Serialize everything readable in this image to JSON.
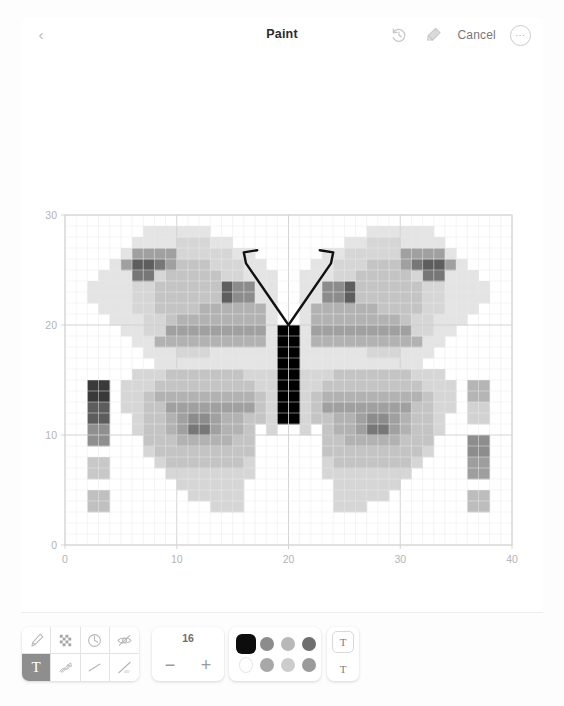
{
  "topbar": {
    "back_icon": "chevron-left-icon",
    "title": "Paint",
    "undo_icon": "undo-history-icon",
    "eraser_icon": "eraser-icon",
    "cancel_label": "Cancel",
    "more_label": "⋯"
  },
  "toolbar": {
    "tools": [
      {
        "name": "brush-tool",
        "glyph": "brush",
        "active": false
      },
      {
        "name": "checker-fill-tool",
        "glyph": "checker",
        "active": false
      },
      {
        "name": "clock-tool",
        "glyph": "clock",
        "active": false
      },
      {
        "name": "visibility-tool",
        "glyph": "eye-slash",
        "active": false
      },
      {
        "name": "text-tool",
        "glyph": "T",
        "active": true
      },
      {
        "name": "scribble-tool",
        "glyph": "scribble",
        "active": false
      },
      {
        "name": "line-tool",
        "glyph": "line",
        "active": false
      },
      {
        "name": "angle-tool",
        "glyph": "angle45",
        "active": false
      }
    ],
    "stepper": {
      "value": "16",
      "decrease_label": "−",
      "increase_label": "+"
    },
    "palette": {
      "colors": [
        {
          "hex": "#0d0d0d",
          "selected": true
        },
        {
          "hex": "#8c8c8c",
          "selected": false
        },
        {
          "hex": "#b8b8b8",
          "selected": false
        },
        {
          "hex": "#6e6e6e",
          "selected": false
        },
        {
          "hex": "#ffffff",
          "selected": false
        },
        {
          "hex": "#a8a8a8",
          "selected": false
        },
        {
          "hex": "#cccccc",
          "selected": false
        },
        {
          "hex": "#9a9a9a",
          "selected": false
        }
      ]
    },
    "text_sizes": [
      {
        "name": "text-size-boxed",
        "label": "T",
        "boxed": true
      },
      {
        "name": "text-size-plain",
        "label": "T",
        "boxed": false
      }
    ]
  },
  "chart_data": {
    "type": "heatmap",
    "title": "",
    "xlabel": "",
    "ylabel": "",
    "xlim": [
      0,
      40
    ],
    "ylim": [
      0,
      30
    ],
    "xticks": [
      0,
      10,
      20,
      30,
      40
    ],
    "yticks": [
      0,
      10,
      20,
      30
    ],
    "grid": true,
    "legend": "none",
    "cell_size": 1,
    "annotations": [
      {
        "name": "left-antenna",
        "type": "polyline",
        "points": [
          [
            20,
            20
          ],
          [
            16.2,
            25.6
          ],
          [
            16.0,
            26.6
          ],
          [
            17.2,
            26.8
          ]
        ]
      },
      {
        "name": "right-antenna",
        "type": "polyline",
        "points": [
          [
            20,
            20
          ],
          [
            23.8,
            25.6
          ],
          [
            24.0,
            26.6
          ],
          [
            22.8,
            26.8
          ]
        ]
      }
    ],
    "colormap": "greys",
    "cells": [
      [
        2,
        13,
        "#3a3a3a"
      ],
      [
        3,
        13,
        "#3a3a3a"
      ],
      [
        2,
        14,
        "#3a3a3a"
      ],
      [
        3,
        14,
        "#3a3a3a"
      ],
      [
        2,
        11,
        "#5d5d5d"
      ],
      [
        3,
        11,
        "#5d5d5d"
      ],
      [
        2,
        12,
        "#5d5d5d"
      ],
      [
        3,
        12,
        "#5d5d5d"
      ],
      [
        2,
        9,
        "#8f8f8f"
      ],
      [
        3,
        9,
        "#8f8f8f"
      ],
      [
        2,
        10,
        "#8f8f8f"
      ],
      [
        3,
        10,
        "#8f8f8f"
      ],
      [
        2,
        6,
        "#c8c8c8"
      ],
      [
        3,
        6,
        "#c8c8c8"
      ],
      [
        2,
        7,
        "#c8c8c8"
      ],
      [
        3,
        7,
        "#c8c8c8"
      ],
      [
        2,
        3,
        "#c0c0c0"
      ],
      [
        3,
        3,
        "#c0c0c0"
      ],
      [
        2,
        4,
        "#c0c0c0"
      ],
      [
        3,
        4,
        "#c0c0c0"
      ],
      [
        36,
        13,
        "#b5b5b5"
      ],
      [
        37,
        13,
        "#b5b5b5"
      ],
      [
        36,
        14,
        "#b5b5b5"
      ],
      [
        37,
        14,
        "#b5b5b5"
      ],
      [
        36,
        11,
        "#d2d2d2"
      ],
      [
        37,
        11,
        "#d2d2d2"
      ],
      [
        36,
        12,
        "#d2d2d2"
      ],
      [
        37,
        12,
        "#d2d2d2"
      ],
      [
        36,
        8,
        "#8d8d8d"
      ],
      [
        37,
        8,
        "#8d8d8d"
      ],
      [
        36,
        9,
        "#8d8d8d"
      ],
      [
        37,
        9,
        "#8d8d8d"
      ],
      [
        36,
        6,
        "#9e9e9e"
      ],
      [
        37,
        6,
        "#9e9e9e"
      ],
      [
        36,
        7,
        "#9e9e9e"
      ],
      [
        37,
        7,
        "#9e9e9e"
      ],
      [
        36,
        3,
        "#bdbdbd"
      ],
      [
        37,
        3,
        "#bdbdbd"
      ],
      [
        36,
        4,
        "#bdbdbd"
      ],
      [
        37,
        4,
        "#bdbdbd"
      ],
      [
        19,
        13,
        "#000000"
      ],
      [
        20,
        13,
        "#000000"
      ],
      [
        19,
        14,
        "#000000"
      ],
      [
        20,
        14,
        "#000000"
      ],
      [
        19,
        15,
        "#000000"
      ],
      [
        20,
        15,
        "#000000"
      ],
      [
        19,
        16,
        "#000000"
      ],
      [
        20,
        16,
        "#000000"
      ],
      [
        19,
        17,
        "#000000"
      ],
      [
        20,
        17,
        "#000000"
      ],
      [
        19,
        18,
        "#000000"
      ],
      [
        20,
        18,
        "#000000"
      ],
      [
        19,
        19,
        "#000000"
      ],
      [
        20,
        19,
        "#000000"
      ],
      [
        19,
        12,
        "#000000"
      ],
      [
        20,
        12,
        "#000000"
      ],
      [
        19,
        11,
        "#000000"
      ],
      [
        20,
        11,
        "#000000"
      ]
    ]
  }
}
